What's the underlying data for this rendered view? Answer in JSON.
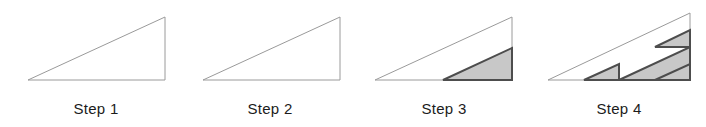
{
  "figure": {
    "background_color": "#ffffff",
    "width": 706,
    "height": 127,
    "outline_color": "#9a9a9a",
    "outline_width": 1,
    "shaded_fill_color": "#c8c8c8",
    "shaded_stroke_color": "#4d4d4d",
    "shaded_stroke_width": 2,
    "label_color": "#1c1c1c",
    "label_font_size": 15,
    "label_baseline_y": 114
  },
  "steps": [
    {
      "id": "step-1",
      "label": "Step 1",
      "label_x": 96,
      "outline_triangle": {
        "left_x": 28,
        "right_x": 165,
        "base_y": 80,
        "apex_y": 17
      },
      "shaded_triangles": [],
      "shaded_count": 0
    },
    {
      "id": "step-2",
      "label": "Step 2",
      "label_x": 270,
      "outline_triangle": {
        "left_x": 203,
        "right_x": 340,
        "base_y": 80,
        "apex_y": 17
      },
      "shaded_triangles": [],
      "shaded_count": 0
    },
    {
      "id": "step-3",
      "label": "Step 3",
      "label_x": 444,
      "outline_triangle": {
        "left_x": 375,
        "right_x": 512,
        "base_y": 80,
        "apex_y": 17
      },
      "shaded_triangles": [
        {
          "left_x": 443,
          "right_x": 512,
          "base_y": 80,
          "apex_y": 48
        }
      ],
      "shaded_count": 1
    },
    {
      "id": "step-4",
      "label": "Step 4",
      "label_x": 619,
      "outline_triangle": {
        "left_x": 548,
        "right_x": 690,
        "base_y": 80,
        "apex_y": 13
      },
      "shaded_triangles": [
        {
          "left_x": 619,
          "right_x": 690,
          "base_y": 80,
          "apex_y": 47
        },
        {
          "left_x": 584,
          "right_x": 619,
          "base_y": 80,
          "apex_y": 64
        },
        {
          "left_x": 655,
          "right_x": 690,
          "base_y": 80,
          "apex_y": 64
        },
        {
          "left_x": 655,
          "right_x": 690,
          "base_y": 47,
          "apex_y": 30
        }
      ],
      "shaded_count": 4
    }
  ],
  "chart_data": {
    "type": "diagram",
    "categories": [
      "Step 1",
      "Step 2",
      "Step 3",
      "Step 4"
    ],
    "values": [
      0,
      0,
      1,
      4
    ],
    "ylabel": "Number of shaded triangles",
    "xlabel": "Iteration step"
  }
}
